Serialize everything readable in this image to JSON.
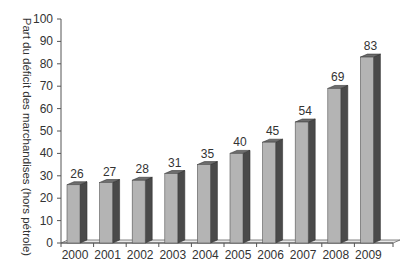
{
  "chart_data": {
    "type": "bar",
    "style": "3d-column",
    "title": "",
    "xlabel": "",
    "ylabel": "Part du déficit des marchandises (hors pétrole)",
    "categories": [
      "2000",
      "2001",
      "2002",
      "2003",
      "2004",
      "2005",
      "2006",
      "2007",
      "2008",
      "2009"
    ],
    "values": [
      26,
      27,
      28,
      31,
      35,
      40,
      45,
      54,
      69,
      83
    ],
    "data_labels": [
      "26",
      "27",
      "28",
      "31",
      "35",
      "40",
      "45",
      "54",
      "69",
      "83"
    ],
    "ylim": [
      0,
      100
    ],
    "yticks": [
      0,
      10,
      20,
      30,
      40,
      50,
      60,
      70,
      80,
      90,
      100
    ],
    "grid": false,
    "legend": null,
    "colors": {
      "front": "#b4b4b4",
      "side": "#4a4a4a",
      "top": "#6e6e6e"
    }
  }
}
